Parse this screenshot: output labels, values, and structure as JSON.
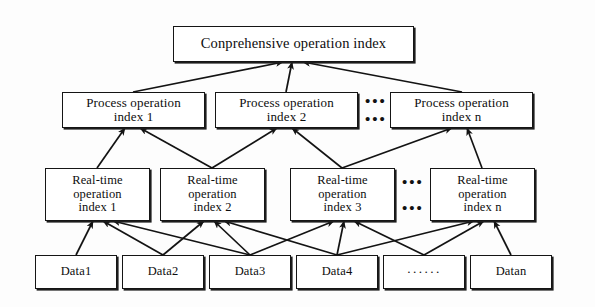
{
  "diagram": {
    "background_color": "#fdfdfd",
    "line_color": "#151515",
    "levels": {
      "level1_label": "Conprehensive operation index",
      "level2": [
        {
          "line1": "Process operation",
          "line2": "index 1"
        },
        {
          "line1": "Process operation",
          "line2": "index 2"
        },
        {
          "line1": "Process operation",
          "line2": "index n"
        }
      ],
      "level3": [
        {
          "line1": "Real-time",
          "line2": "operation",
          "line3": "index 1"
        },
        {
          "line1": "Real-time",
          "line2": "operation",
          "line3": "index 2"
        },
        {
          "line1": "Real-time",
          "line2": "operation",
          "line3": "index 3"
        },
        {
          "line1": "Real-time",
          "line2": "operation",
          "line3": "index n"
        }
      ],
      "level4": [
        {
          "label": "Data1"
        },
        {
          "label": "Data2"
        },
        {
          "label": "Data3"
        },
        {
          "label": "Data4"
        },
        {
          "label": "······"
        },
        {
          "label": "Datan"
        }
      ]
    },
    "ellipsis_marks": {
      "process_row": {
        "top": "•••",
        "bottom": "•••"
      },
      "realtime_row": {
        "top": "•••",
        "bottom": "•••"
      }
    }
  }
}
